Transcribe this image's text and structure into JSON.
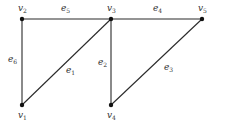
{
  "diagram": {
    "type": "graph",
    "vertices": [
      {
        "id": "v1",
        "label": "v",
        "sub": "1",
        "x": 22,
        "y": 105
      },
      {
        "id": "v2",
        "label": "v",
        "sub": "2",
        "x": 22,
        "y": 19
      },
      {
        "id": "v3",
        "label": "v",
        "sub": "3",
        "x": 111,
        "y": 19
      },
      {
        "id": "v4",
        "label": "v",
        "sub": "4",
        "x": 111,
        "y": 105
      },
      {
        "id": "v5",
        "label": "v",
        "sub": "5",
        "x": 202,
        "y": 19
      }
    ],
    "edges": [
      {
        "id": "e1",
        "label": "e",
        "sub": "1",
        "from": "v1",
        "to": "v3"
      },
      {
        "id": "e2",
        "label": "e",
        "sub": "2",
        "from": "v3",
        "to": "v4"
      },
      {
        "id": "e3",
        "label": "e",
        "sub": "3",
        "from": "v4",
        "to": "v5"
      },
      {
        "id": "e4",
        "label": "e",
        "sub": "4",
        "from": "v3",
        "to": "v5"
      },
      {
        "id": "e5",
        "label": "e",
        "sub": "5",
        "from": "v2",
        "to": "v3"
      },
      {
        "id": "e6",
        "label": "e",
        "sub": "6",
        "from": "v1",
        "to": "v2"
      }
    ]
  }
}
